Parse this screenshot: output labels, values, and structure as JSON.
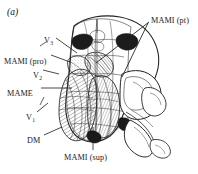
{
  "figure": {
    "panel_id": "(a)",
    "background_color": "#ffffff",
    "ink_color": "#1a1a1a"
  },
  "labels": [
    {
      "id": "mami-pt",
      "text": "MAMI (pt)",
      "sub": "",
      "x": 151,
      "y": 17,
      "anchor": "left"
    },
    {
      "id": "v-upper",
      "text": "V",
      "sub": "3",
      "x": 44,
      "y": 37,
      "anchor": "left"
    },
    {
      "id": "mami-pro",
      "text": "MAMI (pro)",
      "sub": "",
      "x": 4,
      "y": 58,
      "anchor": "left"
    },
    {
      "id": "v-mid",
      "text": "V",
      "sub": "2",
      "x": 33,
      "y": 72,
      "anchor": "left"
    },
    {
      "id": "mame",
      "text": "MAME",
      "sub": "",
      "x": 7,
      "y": 90,
      "anchor": "left"
    },
    {
      "id": "v-lower",
      "text": "V",
      "sub": "1",
      "x": 26,
      "y": 114,
      "anchor": "left"
    },
    {
      "id": "dm",
      "text": "DM",
      "sub": "",
      "x": 27,
      "y": 137,
      "anchor": "left"
    },
    {
      "id": "mami-sup",
      "text": "MAMI (sup)",
      "sub": "",
      "x": 64,
      "y": 154,
      "anchor": "left"
    }
  ],
  "leader_lines": [
    {
      "id": "leader-mami-pt",
      "from": [
        149,
        22
      ],
      "to": [
        96,
        63
      ]
    },
    {
      "id": "leader-mami-pt2",
      "from": [
        148,
        23
      ],
      "to": [
        122,
        77
      ]
    },
    {
      "id": "leader-v-upper",
      "from": [
        56,
        38
      ],
      "to": [
        77,
        53
      ]
    },
    {
      "id": "leader-mami-pro",
      "from": [
        51,
        55
      ],
      "to": [
        70,
        62
      ]
    },
    {
      "id": "leader-v-mid",
      "from": [
        43,
        70
      ],
      "to": [
        59,
        74
      ]
    },
    {
      "id": "leader-mame",
      "from": [
        41,
        88
      ],
      "to": [
        72,
        88
      ]
    },
    {
      "id": "leader-v-lower",
      "from": [
        37,
        112
      ],
      "to": [
        48,
        103
      ]
    },
    {
      "id": "leader-dm",
      "from": [
        44,
        135
      ],
      "to": [
        62,
        127
      ]
    },
    {
      "id": "leader-mami-sup",
      "from": [
        93,
        150
      ],
      "to": [
        93,
        127
      ]
    }
  ]
}
